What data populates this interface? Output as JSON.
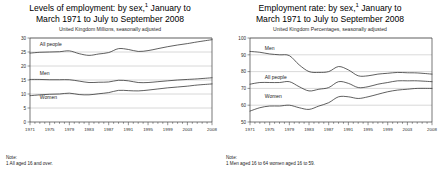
{
  "figure": {
    "panels": [
      {
        "id": "levels",
        "title_line1": "Levels of employment: by sex,",
        "title_sup": "1",
        "title_line2": " January to",
        "title_line3": "March 1971 to July to September 2008",
        "subtitle": "United Kingdom Millions, seasonally adjusted",
        "note_heading": "Note:",
        "note_text": "1 All aged 16 and over.",
        "chart_data": {
          "type": "line",
          "title": "Levels of employment: by sex, January to March 1971 to July to September 2008",
          "subtitle": "United Kingdom Millions, seasonally adjusted",
          "xlabel": "",
          "ylabel": "Millions",
          "xlim": [
            1971,
            2008
          ],
          "ylim": [
            0,
            30
          ],
          "yticks": [
            0,
            5,
            10,
            15,
            20,
            25,
            30
          ],
          "xticks": [
            1971,
            1975,
            1979,
            1983,
            1987,
            1991,
            1995,
            1999,
            2003,
            2008
          ],
          "xtick_labels": [
            "1971",
            "1975",
            "1979",
            "1983",
            "1987",
            "1991",
            "1995",
            "1999",
            "2003",
            "2008"
          ],
          "grid": true,
          "legend_position": "inline-labels",
          "x": [
            1971,
            1973,
            1975,
            1977,
            1979,
            1981,
            1983,
            1985,
            1987,
            1989,
            1991,
            1993,
            1995,
            1997,
            1999,
            2001,
            2003,
            2005,
            2008
          ],
          "series": [
            {
              "name": "All people",
              "label_x": 1973,
              "label_y": 27.2,
              "values": [
                24.6,
                24.9,
                25.0,
                25.1,
                25.4,
                24.4,
                23.8,
                24.3,
                24.8,
                26.2,
                25.9,
                25.2,
                25.5,
                26.2,
                26.9,
                27.5,
                28.0,
                28.6,
                29.4
              ]
            },
            {
              "name": "Men",
              "label_x": 1973,
              "label_y": 16.9,
              "values": [
                15.2,
                15.2,
                15.1,
                15.1,
                15.1,
                14.6,
                14.1,
                14.2,
                14.3,
                14.9,
                14.7,
                14.1,
                14.1,
                14.4,
                14.7,
                15.0,
                15.2,
                15.4,
                15.8
              ]
            },
            {
              "name": "Women",
              "label_x": 1973,
              "label_y": 8.3,
              "values": [
                9.4,
                9.7,
                9.9,
                10.0,
                10.3,
                9.8,
                9.7,
                10.1,
                10.5,
                11.3,
                11.2,
                11.1,
                11.4,
                11.8,
                12.2,
                12.5,
                12.8,
                13.2,
                13.6
              ]
            }
          ]
        }
      },
      {
        "id": "rate",
        "title_line1": "Employment rate: by sex,",
        "title_sup": "1",
        "title_line2": " January to",
        "title_line3": "March 1971 to July to September 2008",
        "subtitle": "United Kingdom Percentages, seasonally adjusted",
        "note_heading": "Note:",
        "note_text": "1 Men aged 16 to 64 women aged 16 to 59.",
        "chart_data": {
          "type": "line",
          "title": "Employment rate: by sex, January to March 1971 to July to September 2008",
          "subtitle": "United Kingdom Percentages, seasonally adjusted",
          "xlabel": "",
          "ylabel": "Percentages",
          "xlim": [
            1971,
            2008
          ],
          "ylim": [
            50,
            100
          ],
          "yticks": [
            50,
            60,
            70,
            80,
            90,
            100
          ],
          "xticks": [
            1971,
            1975,
            1979,
            1983,
            1987,
            1991,
            1995,
            1999,
            2003,
            2008
          ],
          "xtick_labels": [
            "1971",
            "1975",
            "1979",
            "1983",
            "1987",
            "1991",
            "1995",
            "1999",
            "2003",
            "2008"
          ],
          "grid": true,
          "legend_position": "inline-labels",
          "x": [
            1971,
            1973,
            1975,
            1977,
            1979,
            1981,
            1983,
            1985,
            1987,
            1989,
            1991,
            1993,
            1995,
            1997,
            1999,
            2001,
            2003,
            2005,
            2008
          ],
          "series": [
            {
              "name": "Men",
              "label_x": 1974,
              "label_y": 93.0,
              "values": [
                92.0,
                91.5,
                90.5,
                90.0,
                89.5,
                84.0,
                80.0,
                79.5,
                80.0,
                83.0,
                81.0,
                77.5,
                77.5,
                78.5,
                79.0,
                79.5,
                79.3,
                79.2,
                78.5
              ]
            },
            {
              "name": "All people",
              "label_x": 1974,
              "label_y": 75.5,
              "values": [
                72.5,
                73.5,
                73.5,
                73.5,
                74.0,
                71.0,
                68.5,
                69.5,
                70.5,
                74.0,
                73.0,
                70.5,
                71.0,
                72.5,
                73.5,
                74.5,
                74.5,
                74.5,
                74.0
              ]
            },
            {
              "name": "Women",
              "label_x": 1974,
              "label_y": 64.0,
              "values": [
                56.5,
                58.5,
                59.5,
                59.5,
                60.0,
                58.5,
                57.5,
                59.5,
                61.5,
                65.0,
                65.0,
                64.0,
                65.0,
                66.5,
                68.0,
                69.0,
                69.5,
                70.0,
                70.0
              ]
            }
          ]
        }
      }
    ]
  }
}
